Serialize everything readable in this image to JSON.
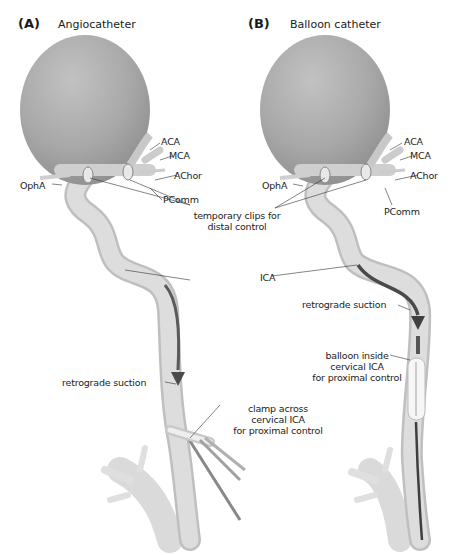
{
  "running_head": "",
  "panels": [
    {
      "letter": "(A)",
      "title": "Angiocatheter",
      "labels": {
        "aca": "ACA",
        "mca": "MCA",
        "achor": "AChor",
        "opha": "OphA",
        "pcomm": "PComm",
        "retrograde": "retrograde suction",
        "clamp_line1": "clamp across",
        "clamp_line2": "cervical ICA",
        "clamp_line3": "for proximal control"
      }
    },
    {
      "letter": "(B)",
      "title": "Balloon catheter",
      "labels": {
        "aca": "ACA",
        "mca": "MCA",
        "achor": "AChor",
        "opha": "OphA",
        "pcomm": "PComm",
        "retrograde": "retrograde suction",
        "balloon_line1": "balloon inside",
        "balloon_line2": "cervical ICA",
        "balloon_line3": "for proximal control"
      }
    }
  ],
  "shared_labels": {
    "temporary_clips_line1": "temporary clips for",
    "temporary_clips_line2": "distal control",
    "ica": "ICA"
  },
  "colors": {
    "vessel": "#d9d9d9",
    "vessel_edge": "#bdbdbd",
    "aneurysm": "#a9a9a9",
    "catheter": "#555555",
    "leader_line": "#333333",
    "balloon": "#f4f4f4"
  }
}
